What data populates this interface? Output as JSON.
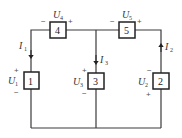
{
  "diagram": {
    "type": "circuit",
    "elements": [
      {
        "id": "1",
        "voltage_label": "U",
        "voltage_sub": "1",
        "polarity_top": "+",
        "polarity_bottom": "−"
      },
      {
        "id": "2",
        "voltage_label": "U",
        "voltage_sub": "2",
        "polarity_top": "−",
        "polarity_bottom": "+"
      },
      {
        "id": "3",
        "voltage_label": "U",
        "voltage_sub": "3",
        "polarity_top": "+",
        "polarity_bottom": "−"
      },
      {
        "id": "4",
        "voltage_label": "U",
        "voltage_sub": "4",
        "polarity_left": "−",
        "polarity_right": "+"
      },
      {
        "id": "5",
        "voltage_label": "U",
        "voltage_sub": "5",
        "polarity_left": "−",
        "polarity_right": "+"
      }
    ],
    "currents": [
      {
        "label": "I",
        "sub": "1",
        "direction": "down"
      },
      {
        "label": "I",
        "sub": "2",
        "direction": "up"
      },
      {
        "label": "I",
        "sub": "3",
        "direction": "down"
      }
    ]
  }
}
